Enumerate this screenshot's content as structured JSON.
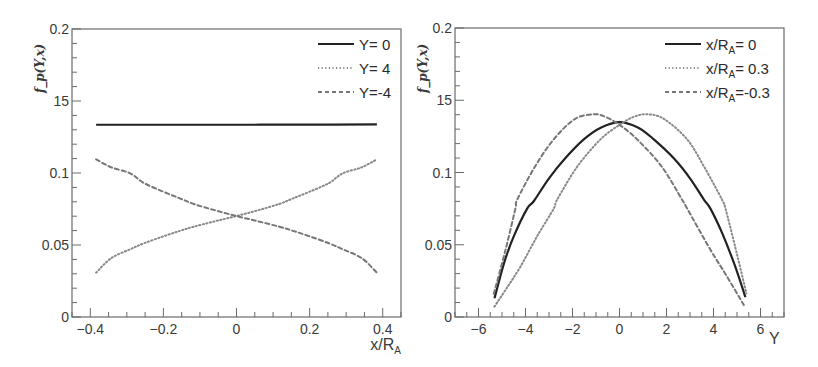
{
  "chart_data": [
    {
      "type": "line",
      "panel": "left",
      "title": "",
      "xlabel": "x/R_A",
      "ylabel": "f_p(Y,x)",
      "xlim": [
        -0.45,
        0.45
      ],
      "ylim": [
        0,
        0.2
      ],
      "xticks": [
        -0.4,
        -0.2,
        0,
        0.2,
        0.4
      ],
      "xticklabels": [
        "−0.4",
        "−0.2",
        "0",
        "0.2",
        "0.4"
      ],
      "yticks": [
        0,
        0.05,
        0.1,
        0.15,
        0.2
      ],
      "yticklabels": [
        "0",
        "0.05",
        "0.1",
        "15",
        "0.2"
      ],
      "grid": false,
      "legend_position": "upper right",
      "series": [
        {
          "name": "Y= 0",
          "style": "solid",
          "color": "#222222",
          "x": [
            -0.384,
            -0.2,
            0,
            0.2,
            0.384
          ],
          "y": [
            0.1335,
            0.1335,
            0.1335,
            0.1336,
            0.1337
          ]
        },
        {
          "name": "Y= 4",
          "style": "dotted",
          "color": "#888888",
          "x": [
            -0.384,
            -0.343,
            -0.291,
            -0.253,
            -0.2,
            -0.155,
            -0.117,
            -0.06,
            0,
            0.06,
            0.117,
            0.155,
            0.2,
            0.253,
            0.291,
            0.343,
            0.384
          ],
          "y": [
            0.0308,
            0.0408,
            0.047,
            0.0512,
            0.056,
            0.0598,
            0.0627,
            0.0664,
            0.0701,
            0.0742,
            0.0785,
            0.0824,
            0.087,
            0.093,
            0.0998,
            0.104,
            0.1095
          ]
        },
        {
          "name": "Y=-4",
          "style": "dashed",
          "color": "#777777",
          "x": [
            -0.384,
            -0.343,
            -0.291,
            -0.253,
            -0.2,
            -0.155,
            -0.117,
            -0.06,
            0,
            0.06,
            0.117,
            0.155,
            0.2,
            0.253,
            0.291,
            0.343,
            0.384
          ],
          "y": [
            0.1095,
            0.104,
            0.0998,
            0.093,
            0.087,
            0.0824,
            0.0785,
            0.0742,
            0.0701,
            0.0664,
            0.0627,
            0.0598,
            0.056,
            0.0512,
            0.047,
            0.0408,
            0.0308
          ]
        }
      ]
    },
    {
      "type": "line",
      "panel": "right",
      "title": "",
      "xlabel": "Y",
      "ylabel": "f_p(Y,x)",
      "xlim": [
        -7,
        7
      ],
      "ylim": [
        0,
        0.2
      ],
      "xticks": [
        -6,
        -4,
        -2,
        0,
        2,
        4,
        6
      ],
      "xticklabels": [
        "−6",
        "−4",
        "−2",
        "0",
        "2",
        "4",
        "6"
      ],
      "yticks": [
        0,
        0.05,
        0.1,
        0.15,
        0.2
      ],
      "yticklabels": [
        "0",
        "0.05",
        "0.1",
        "15",
        "0.2"
      ],
      "grid": false,
      "legend_position": "upper right",
      "series": [
        {
          "name": "x/R_A = 0",
          "style": "solid",
          "color": "#222222",
          "x": [
            -5.32,
            -4.9,
            -4.5,
            -3.93,
            -3.65,
            -3.0,
            -2.3,
            -1.52,
            -0.8,
            0,
            0.8,
            1.46,
            2.3,
            3.0,
            3.59,
            3.87,
            4.37,
            4.9,
            5.36
          ],
          "y": [
            0.013,
            0.038,
            0.0558,
            0.075,
            0.0801,
            0.096,
            0.11,
            0.1229,
            0.131,
            0.1349,
            0.131,
            0.1229,
            0.11,
            0.096,
            0.0813,
            0.075,
            0.058,
            0.036,
            0.0137
          ]
        },
        {
          "name": "x/R_A = 0.3",
          "style": "dotted",
          "color": "#888888",
          "x": [
            -5.32,
            -4.8,
            -4.21,
            -3.5,
            -2.8,
            -2.65,
            -1.8,
            -0.81,
            0,
            0.6,
            1.18,
            1.9,
            2.88,
            3.6,
            4.37,
            4.51,
            4.9,
            5.4
          ],
          "y": [
            0.0072,
            0.02,
            0.035,
            0.056,
            0.075,
            0.0813,
            0.104,
            0.1229,
            0.133,
            0.1385,
            0.1403,
            0.137,
            0.1229,
            0.104,
            0.081,
            0.075,
            0.05,
            0.0164
          ]
        },
        {
          "name": "x/R_A =-0.3",
          "style": "dashed",
          "color": "#777777",
          "x": [
            -5.35,
            -4.85,
            -4.43,
            -4.35,
            -3.6,
            -2.8,
            -1.9,
            -1.09,
            -0.6,
            0,
            0.75,
            1.8,
            2.67,
            2.88,
            3.87,
            4.5,
            5.29
          ],
          "y": [
            0.016,
            0.0465,
            0.075,
            0.0813,
            0.104,
            0.1229,
            0.137,
            0.1403,
            0.1385,
            0.133,
            0.1229,
            0.104,
            0.081,
            0.075,
            0.0465,
            0.03,
            0.0083
          ]
        }
      ]
    }
  ],
  "panels": {
    "left": {
      "ylabel": "f_p(Y,x)",
      "xlabel_main": "x/R",
      "xlabel_sub": "A",
      "legend": [
        {
          "label_main": "Y= 0",
          "label_sub": "",
          "label_tail": ""
        },
        {
          "label_main": "Y= 4",
          "label_sub": "",
          "label_tail": ""
        },
        {
          "label_main": "Y=-4",
          "label_sub": "",
          "label_tail": ""
        }
      ]
    },
    "right": {
      "ylabel": "f_p(Y,x)",
      "xlabel_main": "Y",
      "xlabel_sub": "",
      "legend": [
        {
          "label_main": "x/R",
          "label_sub": "A",
          "label_tail": "= 0"
        },
        {
          "label_main": "x/R",
          "label_sub": "A",
          "label_tail": "= 0.3"
        },
        {
          "label_main": "x/R",
          "label_sub": "A",
          "label_tail": "=-0.3"
        }
      ]
    }
  },
  "colors": {
    "frame": "#6a6a6a",
    "text": "#3a3a3a",
    "solid": "#222222",
    "dotted": "#888888",
    "dashed": "#777777"
  }
}
